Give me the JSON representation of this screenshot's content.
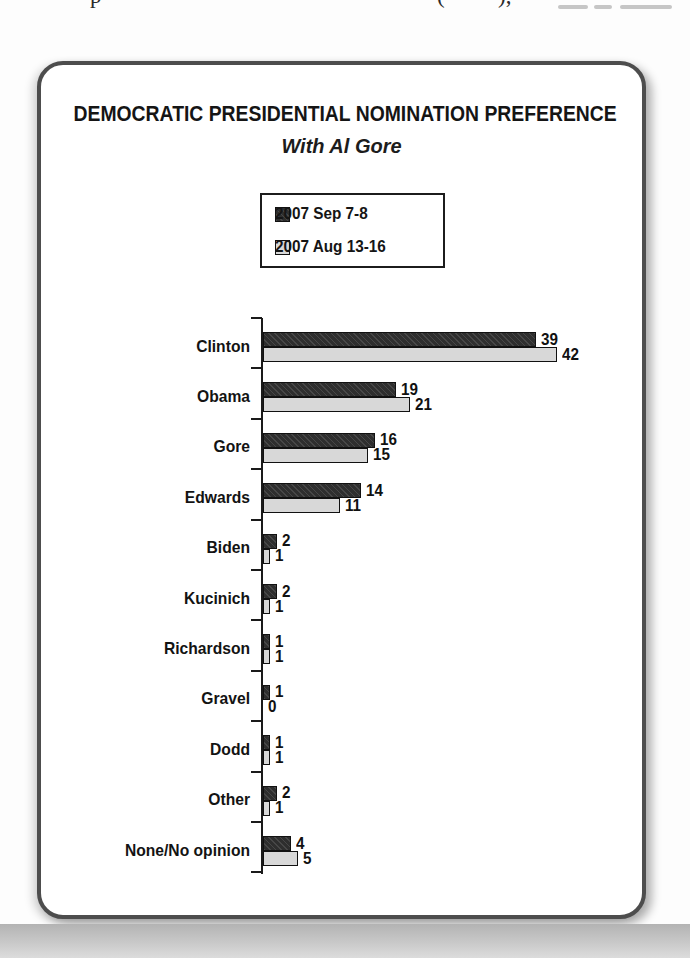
{
  "page": {
    "top_fragments": [
      "p",
      "(",
      "),"
    ]
  },
  "chart_data": {
    "type": "bar",
    "orientation": "horizontal",
    "title": "DEMOCRATIC PRESIDENTIAL NOMINATION PREFERENCE",
    "subtitle": "With Al Gore",
    "categories": [
      "Clinton",
      "Obama",
      "Gore",
      "Edwards",
      "Biden",
      "Kucinich",
      "Richardson",
      "Gravel",
      "Dodd",
      "Other",
      "None/No opinion"
    ],
    "series": [
      {
        "name": "2007 Sep 7-8",
        "swatch": "dark",
        "color": "#2e2e2e",
        "values": [
          39,
          19,
          16,
          14,
          2,
          2,
          1,
          1,
          1,
          2,
          4
        ]
      },
      {
        "name": "2007 Aug 13-16",
        "swatch": "light",
        "color": "#d8d8d8",
        "values": [
          42,
          21,
          15,
          11,
          1,
          1,
          1,
          0,
          1,
          1,
          5
        ]
      }
    ],
    "xlim": [
      0,
      45
    ],
    "value_labels": true,
    "grid": false,
    "legend_position": "top-center"
  },
  "colors": {
    "dark_bar": "#2e2e2e",
    "light_bar": "#d8d8d8",
    "card_border": "#4d4d4d",
    "axis": "#1a1a1a",
    "page_shadow": "#c9c9c9"
  }
}
